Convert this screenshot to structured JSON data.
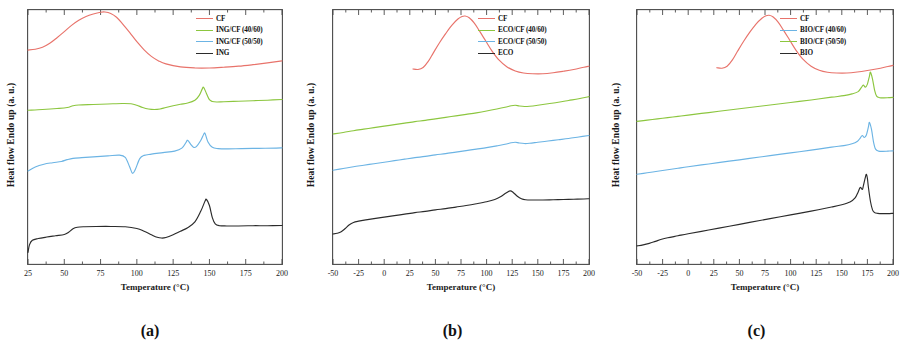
{
  "figure": {
    "ylabel": "Heat flow Endo up (a. u.)",
    "xlabel": "Temperature (°C)",
    "colors": {
      "cf": "#e8736b",
      "green": "#8cc63f",
      "blue": "#6cb4e4",
      "black": "#2b2b2b"
    }
  },
  "chart_data": [
    {
      "type": "line",
      "panel_label": "(a)",
      "title": "",
      "xlabel": "Temperature (°C)",
      "ylabel": "Heat flow Endo up (a. u.)",
      "xlim": [
        25,
        200
      ],
      "ylim": [
        0,
        1
      ],
      "xticks": [
        25,
        50,
        75,
        100,
        125,
        150,
        175,
        200
      ],
      "grid": false,
      "legend_position": "top-right",
      "series": [
        {
          "name": "CF",
          "color": "#e8736b",
          "peak_C": 78,
          "x": [
            25,
            30,
            35,
            40,
            45,
            50,
            55,
            60,
            65,
            70,
            75,
            78,
            82,
            86,
            90,
            95,
            100,
            105,
            110,
            115,
            120,
            130,
            140,
            150,
            160,
            170,
            180,
            190,
            200
          ],
          "y": [
            0.845,
            0.848,
            0.856,
            0.872,
            0.894,
            0.918,
            0.943,
            0.963,
            0.978,
            0.988,
            0.995,
            0.996,
            0.99,
            0.975,
            0.95,
            0.915,
            0.878,
            0.846,
            0.82,
            0.802,
            0.79,
            0.778,
            0.774,
            0.774,
            0.777,
            0.781,
            0.787,
            0.794,
            0.802
          ]
        },
        {
          "name": "ING/CF (40/60)",
          "color": "#8cc63f",
          "peak_C": 146,
          "x": [
            25,
            35,
            45,
            52,
            56,
            60,
            70,
            80,
            90,
            96,
            100,
            104,
            108,
            112,
            116,
            120,
            125,
            130,
            135,
            140,
            143,
            145,
            146,
            148,
            150,
            152,
            155,
            160,
            170,
            180,
            190,
            200
          ],
          "y": [
            0.606,
            0.609,
            0.613,
            0.617,
            0.624,
            0.627,
            0.629,
            0.631,
            0.633,
            0.632,
            0.626,
            0.617,
            0.611,
            0.609,
            0.611,
            0.617,
            0.624,
            0.63,
            0.635,
            0.646,
            0.665,
            0.69,
            0.697,
            0.672,
            0.648,
            0.641,
            0.639,
            0.64,
            0.642,
            0.644,
            0.646,
            0.649
          ]
        },
        {
          "name": "ING/CF (50/50)",
          "color": "#6cb4e4",
          "exotherm_C": 97,
          "peaks_C": [
            135,
            147
          ],
          "x": [
            25,
            30,
            36,
            42,
            48,
            52,
            56,
            62,
            70,
            80,
            88,
            92,
            95,
            97,
            99,
            102,
            105,
            110,
            118,
            126,
            131,
            134,
            135,
            137,
            139,
            141,
            144,
            146,
            147,
            149,
            152,
            156,
            162,
            172,
            184,
            196,
            200
          ],
          "y": [
            0.365,
            0.381,
            0.392,
            0.398,
            0.403,
            0.41,
            0.415,
            0.418,
            0.421,
            0.425,
            0.428,
            0.419,
            0.382,
            0.356,
            0.372,
            0.414,
            0.427,
            0.432,
            0.438,
            0.444,
            0.456,
            0.48,
            0.487,
            0.472,
            0.459,
            0.462,
            0.486,
            0.51,
            0.514,
            0.48,
            0.459,
            0.454,
            0.453,
            0.454,
            0.455,
            0.456,
            0.457
          ]
        },
        {
          "name": "ING",
          "color": "#2b2b2b",
          "glass_step_C": 55,
          "cold_cryst_C": 115,
          "melt_C": 148,
          "x": [
            25,
            26,
            28,
            32,
            38,
            44,
            50,
            53,
            56,
            59,
            64,
            72,
            82,
            92,
            100,
            105,
            110,
            114,
            117,
            120,
            125,
            130,
            135,
            140,
            144,
            147,
            148,
            150,
            152,
            154,
            157,
            162,
            170,
            180,
            190,
            200
          ],
          "y": [
            0.042,
            0.072,
            0.09,
            0.097,
            0.103,
            0.108,
            0.113,
            0.122,
            0.136,
            0.142,
            0.144,
            0.145,
            0.145,
            0.144,
            0.137,
            0.126,
            0.112,
            0.102,
            0.099,
            0.101,
            0.112,
            0.126,
            0.14,
            0.163,
            0.205,
            0.246,
            0.252,
            0.228,
            0.18,
            0.155,
            0.148,
            0.147,
            0.147,
            0.148,
            0.148,
            0.149
          ]
        }
      ],
      "legend": [
        "CF",
        "ING/CF (40/60)",
        "ING/CF (50/50)",
        "ING"
      ]
    },
    {
      "type": "line",
      "panel_label": "(b)",
      "title": "",
      "xlabel": "Temperature (°C)",
      "ylabel": "Heat flow Endo up (a. u.)",
      "xlim": [
        -50,
        200
      ],
      "ylim": [
        0,
        1
      ],
      "xticks": [
        -50,
        -25,
        0,
        25,
        50,
        75,
        100,
        125,
        150,
        175,
        200
      ],
      "grid": false,
      "legend_position": "top-right",
      "series": [
        {
          "name": "CF",
          "color": "#e8736b",
          "peak_C": 78,
          "x": [
            28,
            33,
            38,
            43,
            48,
            54,
            60,
            66,
            72,
            76,
            79,
            83,
            88,
            93,
            99,
            105,
            112,
            120,
            128,
            136,
            145,
            155,
            165,
            175,
            185,
            195,
            200
          ],
          "y": [
            0.77,
            0.768,
            0.776,
            0.8,
            0.834,
            0.874,
            0.91,
            0.943,
            0.968,
            0.978,
            0.98,
            0.973,
            0.952,
            0.921,
            0.882,
            0.843,
            0.806,
            0.778,
            0.762,
            0.754,
            0.751,
            0.751,
            0.755,
            0.761,
            0.768,
            0.777,
            0.781
          ]
        },
        {
          "name": "ECO/CF (40/60)",
          "color": "#8cc63f",
          "x": [
            -50,
            -40,
            -30,
            -20,
            -10,
            0,
            10,
            20,
            30,
            40,
            50,
            60,
            70,
            80,
            90,
            100,
            110,
            118,
            124,
            128,
            132,
            137,
            142,
            150,
            160,
            170,
            180,
            190,
            200
          ],
          "y": [
            0.512,
            0.518,
            0.525,
            0.531,
            0.537,
            0.543,
            0.549,
            0.555,
            0.561,
            0.566,
            0.572,
            0.578,
            0.584,
            0.59,
            0.596,
            0.603,
            0.611,
            0.618,
            0.624,
            0.626,
            0.623,
            0.621,
            0.622,
            0.626,
            0.632,
            0.638,
            0.645,
            0.652,
            0.66
          ]
        },
        {
          "name": "ECO/CF (50/50)",
          "color": "#6cb4e4",
          "x": [
            -50,
            -40,
            -30,
            -20,
            -10,
            0,
            10,
            20,
            30,
            40,
            50,
            60,
            70,
            80,
            90,
            100,
            110,
            118,
            124,
            128,
            132,
            137,
            142,
            150,
            160,
            170,
            180,
            190,
            200
          ],
          "y": [
            0.368,
            0.375,
            0.382,
            0.388,
            0.394,
            0.4,
            0.406,
            0.412,
            0.418,
            0.423,
            0.429,
            0.434,
            0.44,
            0.446,
            0.452,
            0.458,
            0.465,
            0.471,
            0.477,
            0.479,
            0.476,
            0.474,
            0.475,
            0.479,
            0.484,
            0.489,
            0.494,
            0.5,
            0.506
          ]
        },
        {
          "name": "ECO",
          "color": "#2b2b2b",
          "melt_C": 123,
          "x": [
            -50,
            -46,
            -42,
            -38,
            -34,
            -30,
            -25,
            -18,
            -10,
            0,
            10,
            20,
            30,
            40,
            50,
            60,
            70,
            80,
            90,
            100,
            108,
            114,
            119,
            123,
            126,
            130,
            134,
            138,
            145,
            155,
            165,
            175,
            185,
            195,
            200
          ],
          "y": [
            0.115,
            0.118,
            0.124,
            0.137,
            0.152,
            0.161,
            0.166,
            0.171,
            0.176,
            0.182,
            0.188,
            0.194,
            0.2,
            0.205,
            0.211,
            0.216,
            0.222,
            0.228,
            0.235,
            0.243,
            0.252,
            0.264,
            0.278,
            0.286,
            0.28,
            0.265,
            0.255,
            0.251,
            0.25,
            0.25,
            0.251,
            0.252,
            0.253,
            0.254,
            0.255
          ]
        }
      ],
      "legend": [
        "CF",
        "ECO/CF (40/60)",
        "ECO/CF (50/50)",
        "ECO"
      ]
    },
    {
      "type": "line",
      "panel_label": "(c)",
      "title": "",
      "xlabel": "Temperature (°C)",
      "ylabel": "Heat flow Endo up (a. u.)",
      "xlim": [
        -50,
        200
      ],
      "ylim": [
        0,
        1
      ],
      "xticks": [
        -50,
        -25,
        0,
        25,
        50,
        75,
        100,
        125,
        150,
        175,
        200
      ],
      "grid": false,
      "legend_position": "top-right",
      "series": [
        {
          "name": "CF",
          "color": "#e8736b",
          "peak_C": 78,
          "x": [
            28,
            33,
            38,
            43,
            48,
            54,
            60,
            66,
            72,
            76,
            79,
            83,
            88,
            93,
            99,
            105,
            112,
            120,
            128,
            136,
            145,
            155,
            165,
            175,
            185,
            195,
            200
          ],
          "y": [
            0.775,
            0.773,
            0.781,
            0.805,
            0.839,
            0.879,
            0.915,
            0.947,
            0.971,
            0.981,
            0.983,
            0.976,
            0.955,
            0.924,
            0.885,
            0.846,
            0.809,
            0.781,
            0.765,
            0.757,
            0.754,
            0.754,
            0.758,
            0.764,
            0.771,
            0.78,
            0.784
          ]
        },
        {
          "name": "BIO/CF (40/60)",
          "color": "#6cb4e4",
          "melt_C": 177,
          "shoulder_C": 170,
          "x": [
            -50,
            -40,
            -30,
            -20,
            -10,
            0,
            20,
            40,
            60,
            80,
            100,
            120,
            140,
            152,
            160,
            165,
            168,
            170,
            172,
            174,
            176,
            177,
            179,
            181,
            183,
            186,
            190,
            195,
            200
          ],
          "y": [
            0.352,
            0.358,
            0.364,
            0.37,
            0.376,
            0.382,
            0.393,
            0.404,
            0.415,
            0.426,
            0.437,
            0.448,
            0.46,
            0.466,
            0.473,
            0.482,
            0.496,
            0.506,
            0.498,
            0.508,
            0.54,
            0.558,
            0.53,
            0.48,
            0.452,
            0.444,
            0.443,
            0.444,
            0.445
          ]
        },
        {
          "name": "BIO/CF (50/50)",
          "color": "#8cc63f",
          "melt_C": 178,
          "shoulder_C": 171,
          "x": [
            -50,
            -40,
            -30,
            -20,
            -10,
            0,
            20,
            40,
            60,
            80,
            100,
            120,
            140,
            152,
            160,
            166,
            169,
            171,
            173,
            175,
            177,
            178,
            180,
            182,
            184,
            187,
            191,
            196,
            200
          ],
          "y": [
            0.562,
            0.567,
            0.572,
            0.577,
            0.582,
            0.587,
            0.597,
            0.607,
            0.617,
            0.627,
            0.637,
            0.647,
            0.658,
            0.664,
            0.671,
            0.68,
            0.696,
            0.706,
            0.698,
            0.71,
            0.742,
            0.757,
            0.73,
            0.686,
            0.662,
            0.656,
            0.655,
            0.656,
            0.657
          ]
        },
        {
          "name": "BIO",
          "color": "#2b2b2b",
          "melt_C": 175,
          "shoulder_C": 169,
          "x": [
            -50,
            -44,
            -38,
            -32,
            -26,
            -20,
            -10,
            0,
            20,
            40,
            60,
            80,
            100,
            120,
            140,
            150,
            158,
            163,
            166,
            168,
            170,
            171,
            173,
            174,
            175,
            176,
            178,
            180,
            182,
            185,
            190,
            195,
            200
          ],
          "y": [
            0.068,
            0.072,
            0.078,
            0.086,
            0.094,
            0.1,
            0.108,
            0.116,
            0.131,
            0.146,
            0.161,
            0.176,
            0.191,
            0.206,
            0.222,
            0.231,
            0.242,
            0.258,
            0.282,
            0.3,
            0.292,
            0.305,
            0.34,
            0.352,
            0.336,
            0.3,
            0.244,
            0.211,
            0.2,
            0.197,
            0.196,
            0.196,
            0.197
          ]
        }
      ],
      "legend": [
        "CF",
        "BIO/CF (40/60)",
        "BIO/CF (50/50)",
        "BIO"
      ]
    }
  ]
}
